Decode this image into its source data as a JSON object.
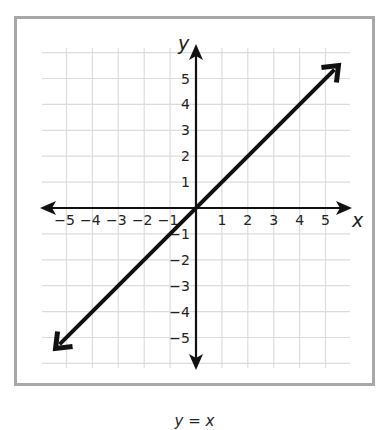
{
  "chart_data": {
    "type": "line",
    "title": "",
    "caption": "y = x",
    "xlabel": "x",
    "ylabel": "y",
    "xlim": [
      -5,
      5
    ],
    "ylim": [
      -5,
      5
    ],
    "grid": true,
    "xticks": [
      -5,
      -4,
      -3,
      -2,
      -1,
      1,
      2,
      3,
      4,
      5
    ],
    "yticks": [
      -5,
      -4,
      -3,
      -2,
      -1,
      1,
      2,
      3,
      4,
      5
    ],
    "xtick_labels": [
      "−5",
      "−4",
      "−3",
      "−2",
      "−1",
      "1",
      "2",
      "3",
      "4",
      "5"
    ],
    "ytick_labels": [
      "−5",
      "−4",
      "−3",
      "−2",
      "−1",
      "1",
      "2",
      "3",
      "4",
      "5"
    ],
    "series": [
      {
        "name": "y = x",
        "x": [
          -5.5,
          -5,
          -4,
          -3,
          -2,
          -1,
          0,
          1,
          2,
          3,
          4,
          5,
          5.5
        ],
        "y": [
          -5.5,
          -5,
          -4,
          -3,
          -2,
          -1,
          0,
          1,
          2,
          3,
          4,
          5,
          5.5
        ],
        "arrows": "both"
      }
    ],
    "colors": {
      "line": "#111111",
      "grid": "#dcdcdc",
      "frame": "#a8a8a8"
    }
  },
  "labels": {
    "x_axis": "x",
    "y_axis": "y",
    "caption": "y = x"
  }
}
